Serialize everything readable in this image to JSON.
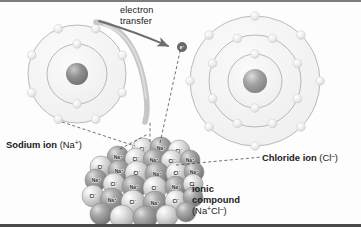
{
  "figure": {
    "background_color": "#fdfdfd",
    "border_top_color": "#7d7d7d",
    "border_bottom_color": "#4a4a4a"
  },
  "annotations": {
    "electron_transfer_line1": "electron",
    "electron_transfer_line2": "transfer",
    "electron_marker": "e",
    "electron_marker_charge": "–",
    "sodium_label_bold": "Sodium ion",
    "sodium_label_formula_open": "(Na",
    "sodium_label_formula_sup": "+",
    "sodium_label_formula_close": ")",
    "chloride_label_bold": "Chloride ion",
    "chloride_label_formula_open": "(Cl",
    "chloride_label_formula_sup": "–",
    "chloride_label_formula_close": ")",
    "ionic_label_line1": "ionic",
    "ionic_label_line2": "compound",
    "ionic_formula_open": "(Na",
    "ionic_formula_sup1": "+",
    "ionic_formula_mid": "Cl",
    "ionic_formula_sup2": "–",
    "ionic_formula_close": ")"
  },
  "atoms": {
    "sodium": {
      "name": "sodium-ion",
      "center_x": 77,
      "center_y": 72,
      "nucleus_radius": 11,
      "shells": [
        {
          "radius": 30,
          "electron_count": 2
        },
        {
          "radius": 49,
          "electron_count": 8
        }
      ],
      "shell_fill": "#f2f2f2",
      "shell_stroke": "#9b9b9b",
      "electron_color": "#e8e8e8",
      "nucleus_color": "#8c8c8c"
    },
    "chloride": {
      "name": "chloride-ion",
      "center_x": 255,
      "center_y": 79,
      "nucleus_radius": 12,
      "shells": [
        {
          "radius": 27,
          "electron_count": 2
        },
        {
          "radius": 46,
          "electron_count": 8
        },
        {
          "radius": 65,
          "electron_count": 8
        }
      ],
      "shell_fill": "#f2f2f2",
      "shell_stroke": "#9b9b9b",
      "electron_color": "#e8e8e8",
      "nucleus_color": "#9a9a9a"
    }
  },
  "crystal": {
    "name": "sodium-chloride-lattice",
    "sodium_symbol": "Na",
    "sodium_charge": "+",
    "chloride_symbol": "Cl",
    "chloride_charge": "–",
    "sodium_color": "#9d9d9d",
    "chloride_color": "#d8d8d8",
    "spheres": [
      {
        "x": 143,
        "y": 147,
        "r": 11,
        "ion": "Cl",
        "charge": "–",
        "shade": "light",
        "label": true
      },
      {
        "x": 161,
        "y": 146,
        "r": 11,
        "ion": "Na",
        "charge": "+",
        "shade": "dark",
        "label": true
      },
      {
        "x": 179,
        "y": 149,
        "r": 11,
        "ion": "Cl",
        "charge": "–",
        "shade": "light",
        "label": true
      },
      {
        "x": 118,
        "y": 155,
        "r": 11,
        "ion": "Na",
        "charge": "+",
        "shade": "dark",
        "label": true
      },
      {
        "x": 136,
        "y": 157,
        "r": 11,
        "ion": "Cl",
        "charge": "–",
        "shade": "light",
        "label": true
      },
      {
        "x": 154,
        "y": 158,
        "r": 11,
        "ion": "Na",
        "charge": "+",
        "shade": "dark",
        "label": true
      },
      {
        "x": 172,
        "y": 159,
        "r": 11,
        "ion": "Cl",
        "charge": "–",
        "shade": "light",
        "label": true
      },
      {
        "x": 190,
        "y": 158,
        "r": 10,
        "ion": "Na",
        "charge": "+",
        "shade": "dark",
        "label": true
      },
      {
        "x": 101,
        "y": 165,
        "r": 11,
        "ion": "Cl",
        "charge": "–",
        "shade": "light",
        "label": true
      },
      {
        "x": 119,
        "y": 169,
        "r": 11,
        "ion": "Na",
        "charge": "+",
        "shade": "dark",
        "label": true
      },
      {
        "x": 137,
        "y": 171,
        "r": 12,
        "ion": "Cl",
        "charge": "–",
        "shade": "light",
        "label": true
      },
      {
        "x": 157,
        "y": 172,
        "r": 12,
        "ion": "Na",
        "charge": "+",
        "shade": "dark",
        "label": true
      },
      {
        "x": 177,
        "y": 171,
        "r": 11,
        "ion": "Cl",
        "charge": "–",
        "shade": "light",
        "label": true
      },
      {
        "x": 194,
        "y": 170,
        "r": 10,
        "ion": "Na",
        "charge": "+",
        "shade": "dark",
        "label": true
      },
      {
        "x": 96,
        "y": 178,
        "r": 11,
        "ion": "Na",
        "charge": "+",
        "shade": "dark",
        "label": true
      },
      {
        "x": 114,
        "y": 182,
        "r": 11,
        "ion": "Cl",
        "charge": "–",
        "shade": "light",
        "label": true
      },
      {
        "x": 134,
        "y": 185,
        "r": 12,
        "ion": "Na",
        "charge": "+",
        "shade": "dark",
        "label": true
      },
      {
        "x": 155,
        "y": 186,
        "r": 12,
        "ion": "Cl",
        "charge": "–",
        "shade": "light",
        "label": true
      },
      {
        "x": 176,
        "y": 185,
        "r": 11,
        "ion": "Na",
        "charge": "+",
        "shade": "dark",
        "label": true
      },
      {
        "x": 193,
        "y": 182,
        "r": 10,
        "ion": "Cl",
        "charge": "–",
        "shade": "light",
        "label": true
      },
      {
        "x": 93,
        "y": 194,
        "r": 11,
        "ion": "Cl",
        "charge": "–",
        "shade": "light",
        "label": true
      },
      {
        "x": 112,
        "y": 198,
        "r": 12,
        "ion": "Na",
        "charge": "+",
        "shade": "dark",
        "label": true
      },
      {
        "x": 133,
        "y": 200,
        "r": 12,
        "ion": "Cl",
        "charge": "–",
        "shade": "light",
        "label": true
      },
      {
        "x": 155,
        "y": 201,
        "r": 12,
        "ion": "Na",
        "charge": "+",
        "shade": "dark",
        "label": true
      },
      {
        "x": 176,
        "y": 199,
        "r": 11,
        "ion": "Cl",
        "charge": "–",
        "shade": "light",
        "label": true
      },
      {
        "x": 193,
        "y": 195,
        "r": 10,
        "ion": "Na",
        "charge": "+",
        "shade": "dark",
        "label": false
      },
      {
        "x": 101,
        "y": 212,
        "r": 11,
        "ion": "Na",
        "charge": "+",
        "shade": "dark",
        "label": false
      },
      {
        "x": 122,
        "y": 215,
        "r": 12,
        "ion": "Cl",
        "charge": "–",
        "shade": "light",
        "label": false
      },
      {
        "x": 145,
        "y": 216,
        "r": 12,
        "ion": "Na",
        "charge": "+",
        "shade": "dark",
        "label": false
      },
      {
        "x": 167,
        "y": 214,
        "r": 11,
        "ion": "Cl",
        "charge": "–",
        "shade": "light",
        "label": false
      },
      {
        "x": 186,
        "y": 210,
        "r": 10,
        "ion": "Na",
        "charge": "+",
        "shade": "dark",
        "label": false
      }
    ]
  },
  "leader_lines": [
    {
      "name": "leader-sodium",
      "x1": 62,
      "y1": 120,
      "x2": 135,
      "y2": 144
    },
    {
      "name": "leader-crystal-left",
      "x1": 120,
      "y1": 147,
      "x2": 148,
      "y2": 132
    },
    {
      "name": "leader-crystal-mid",
      "x1": 150,
      "y1": 140,
      "x2": 150,
      "y2": 120
    },
    {
      "name": "leader-crystal-right",
      "x1": 160,
      "y1": 141,
      "x2": 181,
      "y2": 45
    },
    {
      "name": "leader-chloride",
      "x1": 176,
      "y1": 163,
      "x2": 262,
      "y2": 155
    }
  ]
}
